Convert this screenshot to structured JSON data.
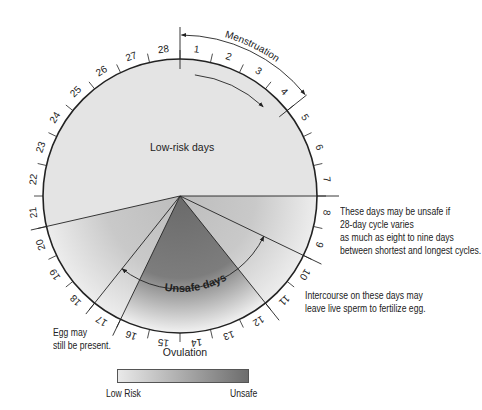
{
  "diagram": {
    "center": {
      "x": 180,
      "y": 196
    },
    "radius": 137,
    "days": [
      "1",
      "2",
      "3",
      "4",
      "5",
      "6",
      "7",
      "8",
      "9",
      "10",
      "11",
      "12",
      "13",
      "14",
      "15",
      "16",
      "17",
      "18",
      "19",
      "20",
      "21",
      "22",
      "23",
      "24",
      "25",
      "26",
      "27",
      "28"
    ],
    "labels": {
      "menstruation": "Menstruation",
      "low_risk_days": "Low-risk days",
      "unsafe_days": "Unsafe days",
      "ovulation": "Ovulation"
    },
    "colors": {
      "low_risk_fill": "#e4e4e4",
      "unsafe_outer": "#c8c8c8",
      "unsafe_core": "#6d6d6d",
      "outline": "#222222"
    }
  },
  "notes": {
    "variation": [
      "These days may be unsafe if",
      "28-day cycle varies",
      "as much as eight to nine days",
      "between shortest and longest cycles."
    ],
    "intercourse": [
      "Intercourse on these days may",
      "leave live sperm to fertilize egg."
    ],
    "egg": [
      "Egg may",
      "still be present."
    ]
  },
  "legend": {
    "low_label": "Low Risk",
    "high_label": "Unsafe",
    "gradient_from": "#e9e9e9",
    "gradient_to": "#6d6d6d"
  }
}
